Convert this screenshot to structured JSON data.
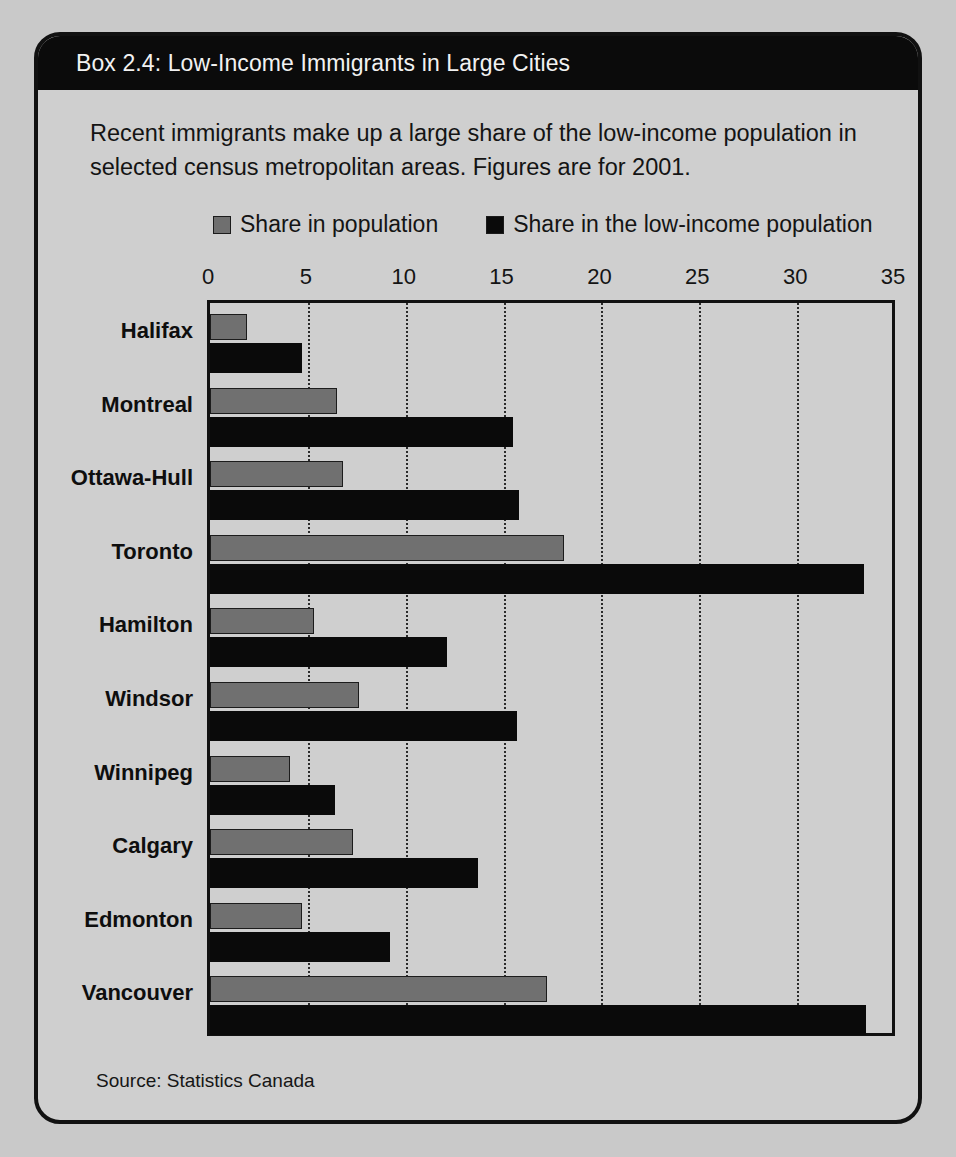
{
  "box": {
    "title": "Box 2.4: Low-Income Immigrants in Large Cities",
    "intro": "Recent immigrants make up a large share of the low-income population in selected census metropolitan areas. Figures are for 2001.",
    "source": "Source: Statistics Canada"
  },
  "legend": {
    "items": [
      {
        "label": "Share in population",
        "color": "#707070"
      },
      {
        "label": "Share in the low-income population",
        "color": "#0a0a0a"
      }
    ]
  },
  "colors": {
    "banner": "#0b0b0b",
    "banner_text": "#f2f2f2",
    "panel": "#cfcfcf",
    "page": "#c9c9c9",
    "series_population": "#707070",
    "series_low_income": "#0a0a0a",
    "axis": "#111111"
  },
  "chart_data": {
    "type": "bar",
    "orientation": "horizontal",
    "title": "Box 2.4: Low-Income Immigrants in Large Cities",
    "subtitle": "Recent immigrants make up a large share of the low-income population in selected census metropolitan areas. Figures are for 2001.",
    "xlabel": "",
    "ylabel": "",
    "xlim": [
      0,
      35
    ],
    "xticks": [
      0,
      5,
      10,
      15,
      20,
      25,
      30,
      35
    ],
    "xtick_labels": [
      "0",
      "5",
      "10",
      "15",
      "20",
      "25",
      "30",
      "35"
    ],
    "grid": "vertical-dotted",
    "legend_position": "above-plot",
    "categories": [
      "Halifax",
      "Montreal",
      "Ottawa-Hull",
      "Toronto",
      "Hamilton",
      "Windsor",
      "Winnipeg",
      "Calgary",
      "Edmonton",
      "Vancouver"
    ],
    "series": [
      {
        "name": "Share in population",
        "color": "#707070",
        "values": [
          1.9,
          6.5,
          6.8,
          18.1,
          5.3,
          7.6,
          4.1,
          7.3,
          4.7,
          17.2
        ]
      },
      {
        "name": "Share in the low-income population",
        "color": "#0a0a0a",
        "values": [
          4.7,
          15.5,
          15.8,
          33.4,
          12.1,
          15.7,
          6.4,
          13.7,
          9.2,
          33.5
        ]
      }
    ],
    "source": "Source: Statistics Canada"
  }
}
